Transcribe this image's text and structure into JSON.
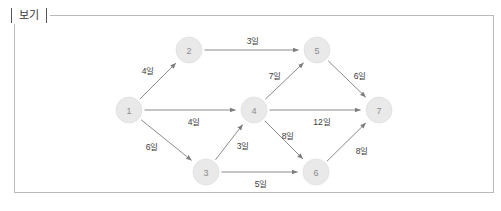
{
  "box": {
    "label": "보기"
  },
  "colors": {
    "node_fill": "#e9e9e9",
    "node_text": "#8b8b8b",
    "edge": "#7d7d7d",
    "edge_label": "#3c3c3c",
    "border": "#b9b9b9",
    "background": "#ffffff"
  },
  "chart_data": {
    "type": "diagram",
    "diagram_type": "directed-network-pert",
    "title": "보기",
    "unit_suffix": "일",
    "nodes": [
      {
        "id": "1",
        "label": "1",
        "x": 129,
        "y": 110,
        "r": 13
      },
      {
        "id": "2",
        "label": "2",
        "x": 189,
        "y": 50,
        "r": 13
      },
      {
        "id": "3",
        "label": "3",
        "x": 206,
        "y": 172,
        "r": 13
      },
      {
        "id": "4",
        "label": "4",
        "x": 254,
        "y": 110,
        "r": 13
      },
      {
        "id": "5",
        "label": "5",
        "x": 317,
        "y": 50,
        "r": 13
      },
      {
        "id": "6",
        "label": "6",
        "x": 316,
        "y": 172,
        "r": 13
      },
      {
        "id": "7",
        "label": "7",
        "x": 379,
        "y": 110,
        "r": 13
      }
    ],
    "edges": [
      {
        "from": "1",
        "to": "2",
        "weight": 4,
        "label": "4일",
        "lx": 148,
        "ly": 71
      },
      {
        "from": "1",
        "to": "4",
        "weight": 4,
        "label": "4일",
        "lx": 194,
        "ly": 122
      },
      {
        "from": "1",
        "to": "3",
        "weight": 6,
        "label": "6일",
        "lx": 152,
        "ly": 147
      },
      {
        "from": "2",
        "to": "5",
        "weight": 3,
        "label": "3일",
        "lx": 253,
        "ly": 41
      },
      {
        "from": "3",
        "to": "4",
        "weight": 3,
        "label": "3일",
        "lx": 243,
        "ly": 146
      },
      {
        "from": "3",
        "to": "6",
        "weight": 5,
        "label": "5일",
        "lx": 261,
        "ly": 184
      },
      {
        "from": "4",
        "to": "5",
        "weight": 7,
        "label": "7일",
        "lx": 275,
        "ly": 76
      },
      {
        "from": "4",
        "to": "7",
        "weight": 12,
        "label": "12일",
        "lx": 322,
        "ly": 122
      },
      {
        "from": "4",
        "to": "6",
        "weight": 8,
        "label": "8일",
        "lx": 288,
        "ly": 136
      },
      {
        "from": "5",
        "to": "7",
        "weight": 6,
        "label": "6일",
        "lx": 360,
        "ly": 76
      },
      {
        "from": "6",
        "to": "7",
        "weight": 8,
        "label": "8일",
        "lx": 362,
        "ly": 151
      }
    ]
  }
}
